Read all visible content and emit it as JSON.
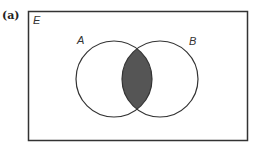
{
  "diagram": {
    "part_label": "(a)",
    "universal_label": "E",
    "sets": [
      {
        "label": "A",
        "cx": 114,
        "cy": 79,
        "r": 38
      },
      {
        "label": "B",
        "cx": 160,
        "cy": 79,
        "r": 38
      }
    ],
    "shaded_region": "A ∩ B",
    "colors": {
      "stroke": "#333333",
      "shade": "#555555",
      "background": "#ffffff"
    }
  }
}
